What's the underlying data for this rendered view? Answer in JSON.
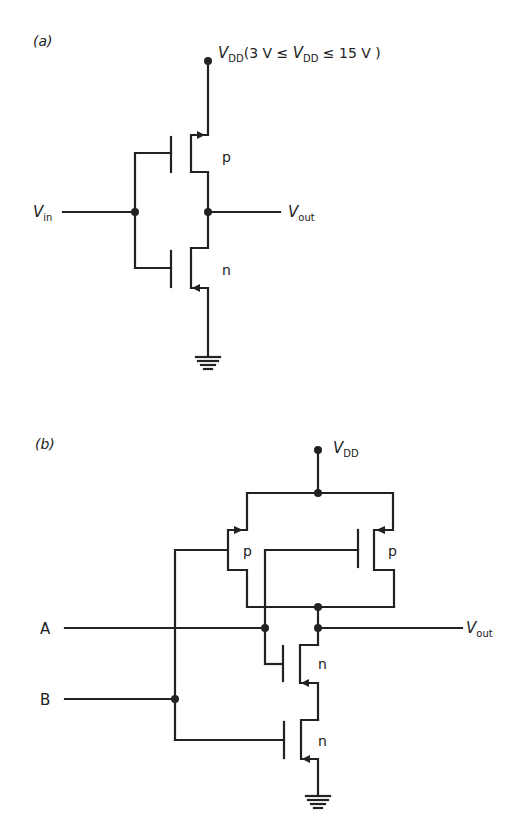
{
  "figure": {
    "panel_a": {
      "label": "(a)",
      "supply_label": "V",
      "supply_sub": "DD",
      "supply_range": "(3 V ≤ ",
      "supply_range_v": "V",
      "supply_range_sub": "DD",
      "supply_range_end": " ≤ 15 V )",
      "input_label": "V",
      "input_sub": "in",
      "output_label": "V",
      "output_sub": "out",
      "pmos_label": "p",
      "nmos_label": "n"
    },
    "panel_b": {
      "label": "(b)",
      "supply_label": "V",
      "supply_sub": "DD",
      "input_a": "A",
      "input_b": "B",
      "output_label": "V",
      "output_sub": "out",
      "pmos_left_label": "p",
      "pmos_right_label": "p",
      "nmos_top_label": "n",
      "nmos_bottom_label": "n"
    }
  }
}
